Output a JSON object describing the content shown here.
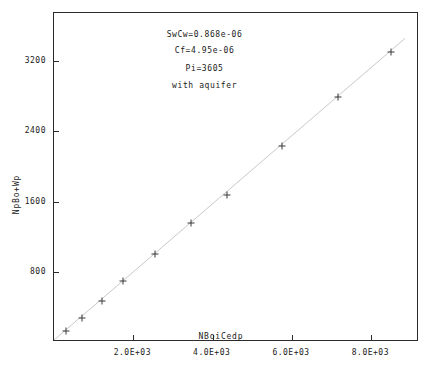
{
  "chart_data": {
    "type": "scatter",
    "title": "",
    "xlabel": "NBoiCedp",
    "ylabel": "NpBo+Wp",
    "xlim": [
      0,
      9200
    ],
    "ylim": [
      0,
      3750
    ],
    "grid": false,
    "legend": null,
    "x_ticks": [
      {
        "value": 2000,
        "label": "2.0E+03"
      },
      {
        "value": 4000,
        "label": "4.0E+03"
      },
      {
        "value": 6000,
        "label": "6.0E+03"
      },
      {
        "value": 8000,
        "label": "8.0E+03"
      }
    ],
    "y_ticks": [
      {
        "value": 800,
        "label": "800"
      },
      {
        "value": 1600,
        "label": "1600"
      },
      {
        "value": 2400,
        "label": "2400"
      },
      {
        "value": 3200,
        "label": "3200"
      }
    ],
    "points": [
      {
        "x": 300,
        "y": 120
      },
      {
        "x": 700,
        "y": 270
      },
      {
        "x": 1200,
        "y": 470
      },
      {
        "x": 1750,
        "y": 690
      },
      {
        "x": 2550,
        "y": 1000
      },
      {
        "x": 3450,
        "y": 1360
      },
      {
        "x": 4350,
        "y": 1680
      },
      {
        "x": 5750,
        "y": 2230
      },
      {
        "x": 7150,
        "y": 2790
      },
      {
        "x": 8500,
        "y": 3300
      }
    ],
    "trendline": {
      "x0": 0,
      "y0": 0,
      "x1": 8900,
      "y1": 3460
    },
    "annotations": [
      {
        "text": "SwCw=0.868e-06",
        "x": 3820,
        "y": 3490
      },
      {
        "text": "Cf=4.95e-06",
        "x": 3820,
        "y": 3300
      },
      {
        "text": "Pi=3605",
        "x": 3820,
        "y": 3100
      },
      {
        "text": "with aquifer",
        "x": 3820,
        "y": 2905
      }
    ]
  },
  "colors": {
    "frame": "#2b2b2b",
    "marker": "#3a3a3a",
    "trendline": "#c9c9c9",
    "text": "#1a1a1a",
    "background": "#ffffff"
  }
}
